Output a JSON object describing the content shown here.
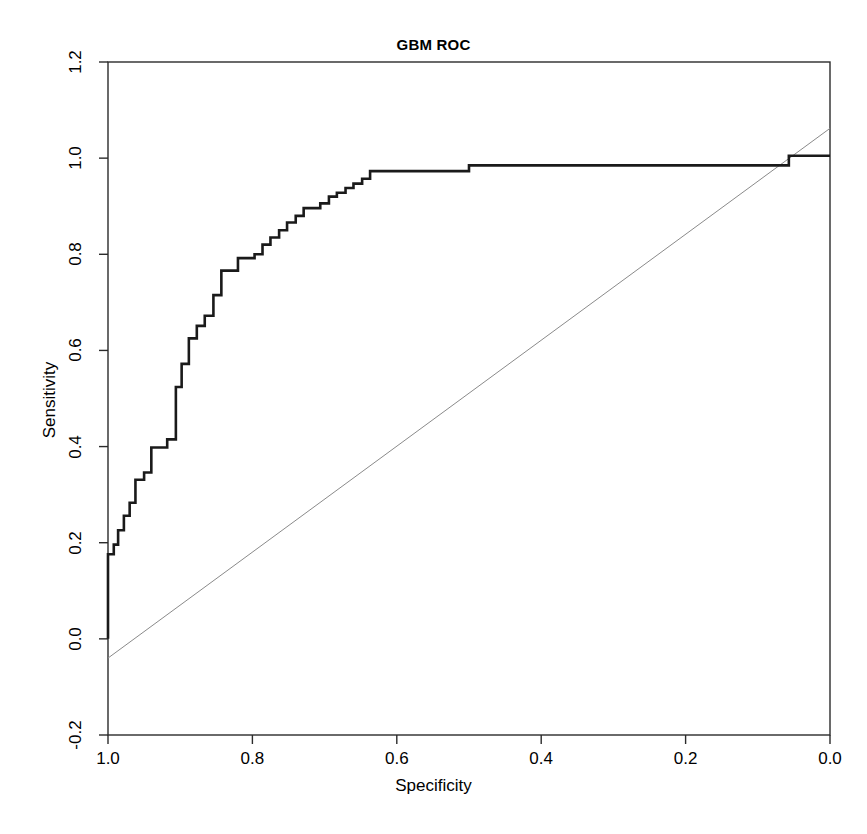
{
  "chart_data": {
    "type": "line",
    "title": "GBM ROC",
    "xlabel": "Specificity",
    "ylabel": "Sensitivity",
    "grid": false,
    "legend": null,
    "x_reversed": true,
    "xlim": [
      1.0,
      0.0
    ],
    "ylim": [
      -0.2,
      1.2
    ],
    "xticks": [
      "1.0",
      "0.8",
      "0.6",
      "0.4",
      "0.2",
      "0.0"
    ],
    "xtick_values": [
      1.0,
      0.8,
      0.6,
      0.4,
      0.2,
      0.0
    ],
    "yticks": [
      "-0.2",
      "0.0",
      "0.2",
      "0.4",
      "0.6",
      "0.8",
      "1.0",
      "1.2"
    ],
    "ytick_values": [
      -0.2,
      0.0,
      0.2,
      0.4,
      0.6,
      0.8,
      1.0,
      1.2
    ],
    "series": [
      {
        "name": "ROC curve",
        "style": "step",
        "color": "#1a1a1a",
        "width": 2.6,
        "points": [
          [
            1.0,
            0.0
          ],
          [
            1.0,
            0.176
          ],
          [
            0.992,
            0.176
          ],
          [
            0.992,
            0.196
          ],
          [
            0.986,
            0.196
          ],
          [
            0.986,
            0.226
          ],
          [
            0.978,
            0.226
          ],
          [
            0.978,
            0.256
          ],
          [
            0.97,
            0.256
          ],
          [
            0.97,
            0.283
          ],
          [
            0.962,
            0.283
          ],
          [
            0.962,
            0.331
          ],
          [
            0.95,
            0.331
          ],
          [
            0.95,
            0.346
          ],
          [
            0.94,
            0.346
          ],
          [
            0.94,
            0.398
          ],
          [
            0.918,
            0.398
          ],
          [
            0.918,
            0.415
          ],
          [
            0.906,
            0.415
          ],
          [
            0.906,
            0.524
          ],
          [
            0.898,
            0.524
          ],
          [
            0.898,
            0.572
          ],
          [
            0.888,
            0.572
          ],
          [
            0.888,
            0.625
          ],
          [
            0.877,
            0.625
          ],
          [
            0.877,
            0.651
          ],
          [
            0.866,
            0.651
          ],
          [
            0.866,
            0.672
          ],
          [
            0.854,
            0.672
          ],
          [
            0.854,
            0.715
          ],
          [
            0.843,
            0.715
          ],
          [
            0.843,
            0.766
          ],
          [
            0.82,
            0.766
          ],
          [
            0.82,
            0.792
          ],
          [
            0.797,
            0.792
          ],
          [
            0.797,
            0.8
          ],
          [
            0.786,
            0.8
          ],
          [
            0.786,
            0.82
          ],
          [
            0.775,
            0.82
          ],
          [
            0.775,
            0.835
          ],
          [
            0.763,
            0.835
          ],
          [
            0.763,
            0.85
          ],
          [
            0.752,
            0.85
          ],
          [
            0.752,
            0.866
          ],
          [
            0.74,
            0.866
          ],
          [
            0.74,
            0.88
          ],
          [
            0.729,
            0.88
          ],
          [
            0.729,
            0.896
          ],
          [
            0.706,
            0.896
          ],
          [
            0.706,
            0.906
          ],
          [
            0.694,
            0.906
          ],
          [
            0.694,
            0.92
          ],
          [
            0.683,
            0.92
          ],
          [
            0.683,
            0.928
          ],
          [
            0.671,
            0.928
          ],
          [
            0.671,
            0.938
          ],
          [
            0.66,
            0.938
          ],
          [
            0.66,
            0.947
          ],
          [
            0.648,
            0.947
          ],
          [
            0.648,
            0.957
          ],
          [
            0.637,
            0.957
          ],
          [
            0.637,
            0.973
          ],
          [
            0.5,
            0.973
          ],
          [
            0.5,
            0.985
          ],
          [
            0.057,
            0.985
          ],
          [
            0.057,
            1.005
          ],
          [
            0.0,
            1.005
          ]
        ]
      },
      {
        "name": "chance diagonal",
        "style": "line",
        "color": "#8a8a8a",
        "width": 1.0,
        "points": [
          [
            1.0,
            -0.04
          ],
          [
            0.0,
            1.062
          ]
        ]
      }
    ]
  },
  "figure": {
    "panel": {
      "left_px": 108,
      "right_px": 830,
      "top_px": 62,
      "bottom_px": 735,
      "border_color": "#2b2b2b",
      "background": "#ffffff"
    }
  }
}
